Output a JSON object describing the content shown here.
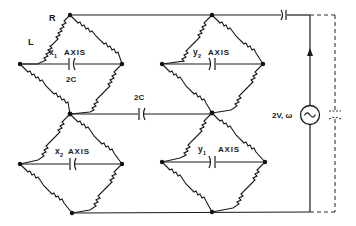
{
  "diagram": {
    "type": "circuit-schematic",
    "labels": {
      "R": "R",
      "L": "L",
      "x1_var": "x",
      "x1_sub": "1",
      "x1_axis": "AXIS",
      "x1_cap": "2C",
      "y2_var": "y",
      "y2_sub": "2",
      "y2_axis": "AXIS",
      "x2_var": "x",
      "x2_sub": "2",
      "x2_axis": "AXIS",
      "y1_var": "y",
      "y1_sub": "1",
      "y1_axis": "AXIS",
      "mid_cap": "2C",
      "source": "2V, ω"
    },
    "bridges": [
      {
        "name": "x1-axis-bridge",
        "position": "top-left",
        "label": "x1 AXIS",
        "center_cap": "2C"
      },
      {
        "name": "y2-axis-bridge",
        "position": "top-right",
        "label": "y2 AXIS"
      },
      {
        "name": "x2-axis-bridge",
        "position": "bottom-left",
        "label": "x2 AXIS"
      },
      {
        "name": "y1-axis-bridge",
        "position": "bottom-right",
        "label": "y1 AXIS"
      }
    ],
    "source_symbol": "~",
    "colors": {
      "ink": "#1a1a1a",
      "background": "#ffffff"
    }
  }
}
